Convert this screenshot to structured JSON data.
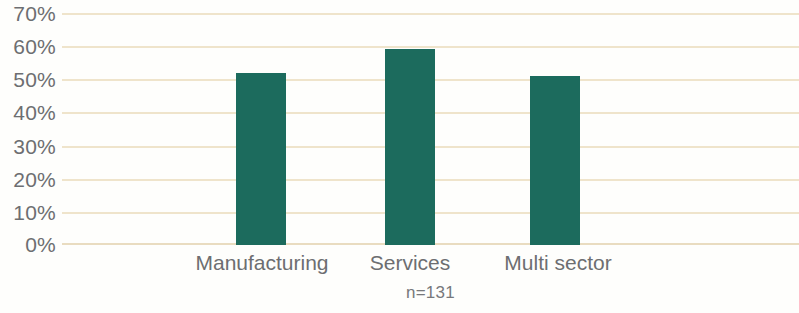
{
  "chart_data": {
    "type": "bar",
    "title": "",
    "subtitle": "",
    "xlabel": "",
    "ylabel": "",
    "categories": [
      "Manufacturing",
      "Services",
      "Multi sector"
    ],
    "values": [
      52,
      59,
      51
    ],
    "series": [
      {
        "name": "Share of respondents",
        "values": [
          52,
          59,
          51
        ]
      }
    ],
    "ylim": [
      0,
      70
    ],
    "ytick_values": [
      0,
      10,
      20,
      30,
      40,
      50,
      60,
      70
    ],
    "ytick_labels": [
      "0%",
      "10%",
      "20%",
      "30%",
      "40%",
      "50%",
      "60%",
      "70%"
    ],
    "grid": true,
    "legend": false,
    "legend_position": "none",
    "annotations": [
      "n=131"
    ],
    "colors": {
      "bar": "#1c6b5d",
      "gridline": "#efe4cb",
      "baseline": "#e9dcc0",
      "tick_label": "#6d6e71",
      "annotation": "#77787b",
      "background": "#fefefc"
    }
  },
  "axis": {
    "y_ticks": [
      {
        "label": "70%",
        "value": 70
      },
      {
        "label": "60%",
        "value": 60
      },
      {
        "label": "50%",
        "value": 50
      },
      {
        "label": "40%",
        "value": 40
      },
      {
        "label": "30%",
        "value": 30
      },
      {
        "label": "20%",
        "value": 20
      },
      {
        "label": "10%",
        "value": 10
      },
      {
        "label": "0%",
        "value": 0
      }
    ],
    "x_categories": [
      {
        "label": "Manufacturing"
      },
      {
        "label": "Services"
      },
      {
        "label": "Multi sector"
      }
    ]
  },
  "footnote": {
    "text": "n=131"
  }
}
